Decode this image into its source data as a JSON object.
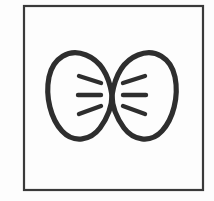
{
  "image": {
    "title": "Bow Tie Line Icon",
    "subject": "bow-tie",
    "style": "hand-drawn black line art",
    "background_color": "#fdfdfd",
    "stroke_color": "#2e2e2e",
    "canvas_width": 214,
    "canvas_height": 201
  },
  "frame": {
    "label": "rectangular border frame",
    "x": 24,
    "y": 6,
    "width": 179,
    "height": 184,
    "stroke_color": "#3a3a3a",
    "stroke_width": 2.2
  },
  "bow_tie": {
    "label": "bow tie",
    "center_x": 112,
    "center_y": 95,
    "left_edge": 47,
    "right_edge": 177,
    "top_edge": 53,
    "bottom_edge": 139,
    "stroke_color": "#2e2e2e",
    "stroke_width": 5.2,
    "left_wing": {
      "label": "left bow wing",
      "path": "M112,95 C108,74 100,60 85,55 C68,49 53,60 50,78 C47,96 52,118 63,130 C74,142 90,139 99,128 C108,117 112,106 112,95 Z"
    },
    "right_wing": {
      "label": "right bow wing",
      "path": "M112,95 C116,74 124,60 139,55 C156,49 171,60 174,78 C177,96 172,118 161,130 C150,142 134,139 125,128 C116,117 112,106 112,95 Z"
    },
    "left_dashes": [
      {
        "label": "left upper dash",
        "x1": 79,
        "y1": 76,
        "x2": 101,
        "y2": 83
      },
      {
        "label": "left middle dash",
        "x1": 78,
        "y1": 95,
        "x2": 101,
        "y2": 95
      },
      {
        "label": "left lower dash",
        "x1": 79,
        "y1": 114,
        "x2": 101,
        "y2": 106
      }
    ],
    "right_dashes": [
      {
        "label": "right upper dash",
        "x1": 145,
        "y1": 76,
        "x2": 123,
        "y2": 83
      },
      {
        "label": "right middle dash",
        "x1": 146,
        "y1": 95,
        "x2": 123,
        "y2": 95
      },
      {
        "label": "right lower dash",
        "x1": 145,
        "y1": 114,
        "x2": 123,
        "y2": 106
      }
    ],
    "dash_stroke_width": 4.4
  }
}
